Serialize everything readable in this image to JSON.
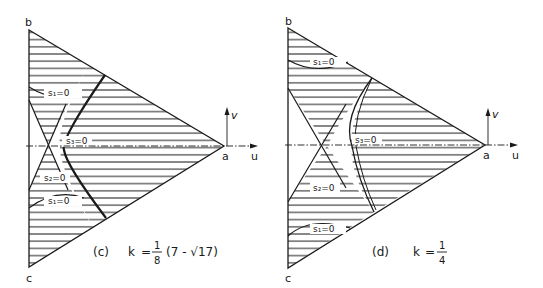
{
  "figure": {
    "colors": {
      "ink": "#1a1a1a",
      "background": "#ffffff"
    },
    "panels": [
      {
        "id": "c",
        "caption_tag": "(c)",
        "k_label": "k",
        "equals": "=",
        "frac_num": "1",
        "frac_den": "8",
        "tail": "(7 - √17)",
        "vertices": {
          "b": "b",
          "c": "c",
          "a": "a"
        },
        "axes": {
          "u": "u",
          "v": "v"
        },
        "curves": {
          "s1_top": "s₁=0",
          "s1_bot": "s₁=0",
          "s2": "s₂=0",
          "s3": "s₃=0"
        }
      },
      {
        "id": "d",
        "caption_tag": "(d)",
        "k_label": "k",
        "equals": "=",
        "frac_num": "1",
        "frac_den": "4",
        "tail": "",
        "vertices": {
          "b": "b",
          "c": "c",
          "a": "a"
        },
        "axes": {
          "u": "u",
          "v": "v"
        },
        "curves": {
          "s1_top": "s₁=0",
          "s1_bot": "s₁=0",
          "s2": "s₂=0",
          "s3": "s₃=0"
        }
      }
    ]
  }
}
